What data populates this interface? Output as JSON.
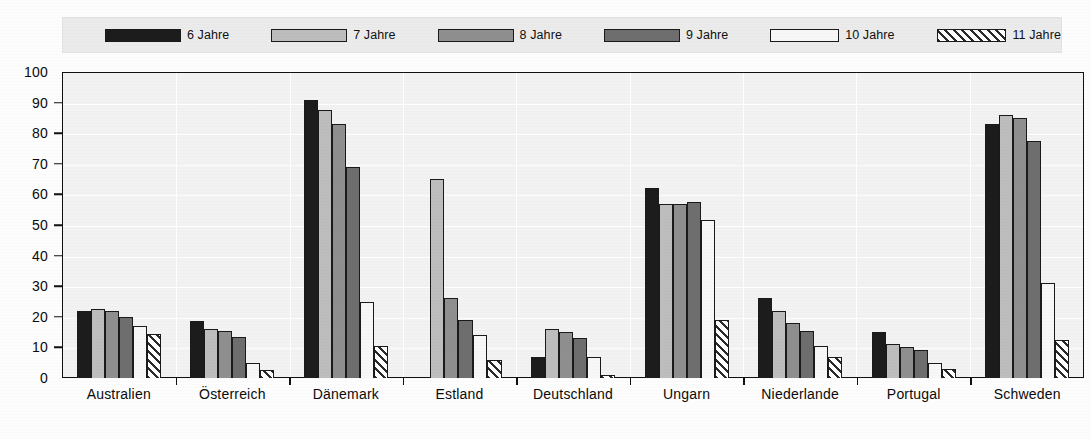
{
  "chart_data": {
    "type": "bar",
    "title": "",
    "subtitle": "",
    "xlabel": "",
    "ylabel": "",
    "ylim": [
      0,
      100
    ],
    "yticks": [
      0,
      10,
      20,
      30,
      40,
      50,
      60,
      70,
      80,
      90,
      100
    ],
    "grid": true,
    "legend_position": "top",
    "categories": [
      "Australien",
      "Österreich",
      "Dänemark",
      "Estland",
      "Deutschland",
      "Ungarn",
      "Niederlande",
      "Portugal",
      "Schweden"
    ],
    "series": [
      {
        "name": "6 Jahre",
        "color": "#1c1c1c",
        "pattern": "solid",
        "values": [
          22,
          18.5,
          91,
          0,
          7,
          62,
          26,
          15,
          83
        ]
      },
      {
        "name": "7 Jahre",
        "color": "#bdbdbd",
        "pattern": "solid",
        "values": [
          22.5,
          16,
          87.5,
          65,
          16,
          57,
          22,
          11,
          86
        ]
      },
      {
        "name": "8 Jahre",
        "color": "#8f8f8f",
        "pattern": "solid",
        "values": [
          22,
          15.5,
          83,
          26,
          15,
          57,
          18,
          10,
          85
        ]
      },
      {
        "name": "9 Jahre",
        "color": "#6e6e6e",
        "pattern": "solid",
        "values": [
          20,
          13.5,
          69,
          19,
          13,
          57.5,
          15.5,
          9,
          77.5
        ]
      },
      {
        "name": "10 Jahre",
        "color": "#f7f7f7",
        "pattern": "solid",
        "values": [
          17,
          5,
          25,
          14,
          7,
          51.5,
          10.5,
          5,
          31
        ]
      },
      {
        "name": "11 Jahre",
        "color": "#ffffff",
        "pattern": "diagonal-hatch",
        "values": [
          14.5,
          2.5,
          10.5,
          6,
          1,
          19,
          7,
          3,
          12.5
        ]
      }
    ]
  },
  "legend": {
    "items": [
      {
        "label": "6 Jahre",
        "swatch": "legend-swatch-6-jahre"
      },
      {
        "label": "7 Jahre",
        "swatch": "legend-swatch-7-jahre"
      },
      {
        "label": "8 Jahre",
        "swatch": "legend-swatch-8-jahre"
      },
      {
        "label": "9 Jahre",
        "swatch": "legend-swatch-9-jahre"
      },
      {
        "label": "10 Jahre",
        "swatch": "legend-swatch-10-jahre"
      },
      {
        "label": "11 Jahre",
        "swatch": "legend-swatch-11-jahre"
      }
    ]
  },
  "axis": {
    "y_tick_labels": [
      "100",
      "90",
      "80",
      "70",
      "60",
      "50",
      "40",
      "30",
      "20",
      "10",
      "0"
    ]
  }
}
